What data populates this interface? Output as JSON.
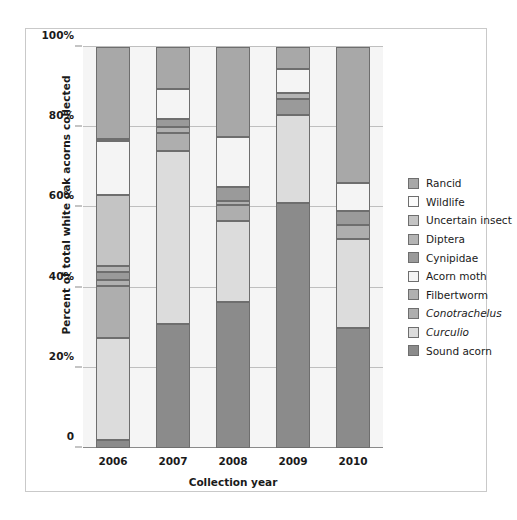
{
  "figure": {
    "y_axis_title": "Percent of total white oak acorns collected",
    "x_axis_title": "Collection year"
  },
  "legend": {
    "items": [
      {
        "label": "Rancid",
        "color": "#a8a8a8",
        "italic": false
      },
      {
        "label": "Wildlife",
        "color": "#fbfbfb",
        "italic": false
      },
      {
        "label": "Uncertain insect",
        "color": "#c4c4c4",
        "italic": false
      },
      {
        "label": "Diptera",
        "color": "#b4b4b4",
        "italic": false
      },
      {
        "label": "Cynipidae",
        "color": "#9a9a9a",
        "italic": false
      },
      {
        "label": "Acorn moth",
        "color": "#f4f4f4",
        "italic": false
      },
      {
        "label": "Filbertworm",
        "color": "#b0b0b0",
        "italic": false
      },
      {
        "label": "Conotrachelus",
        "color": "#aeaeae",
        "italic": true
      },
      {
        "label": "Curculio",
        "color": "#dcdcdc",
        "italic": true
      },
      {
        "label": "Sound acorn",
        "color": "#8b8b8b",
        "italic": false
      }
    ]
  },
  "chart_data": {
    "type": "bar",
    "subtype": "stacked-percent",
    "title": "",
    "xlabel": "Collection year",
    "ylabel": "Percent of total white oak acorns collected",
    "categories": [
      "2006",
      "2007",
      "2008",
      "2009",
      "2010"
    ],
    "ylim": [
      0,
      100
    ],
    "ytick_labels": [
      "0",
      "20%",
      "40%",
      "60%",
      "80%",
      "100%"
    ],
    "ytick_values": [
      0,
      20,
      40,
      60,
      80,
      100
    ],
    "grid": true,
    "legend_position": "right",
    "stack_order_bottom_to_top": [
      "Sound acorn",
      "Curculio",
      "Conotrachelus",
      "Filbertworm",
      "Acorn moth",
      "Cynipidae",
      "Diptera",
      "Uncertain insect",
      "Wildlife",
      "Rancid"
    ],
    "series": [
      {
        "name": "Sound acorn",
        "color": "#8b8b8b",
        "values": [
          2.0,
          31.0,
          36.5,
          61.0,
          30.0
        ]
      },
      {
        "name": "Curculio",
        "color": "#dcdcdc",
        "values": [
          25.5,
          43.0,
          20.0,
          22.0,
          22.0
        ]
      },
      {
        "name": "Conotrachelus",
        "color": "#aeaeae",
        "values": [
          13.0,
          3.0,
          4.0,
          0.0,
          3.5
        ]
      },
      {
        "name": "Filbertworm",
        "color": "#b0b0b0",
        "values": [
          1.5,
          1.5,
          1.0,
          0.0,
          0.0
        ]
      },
      {
        "name": "Acorn moth",
        "color": "#f4f4f4",
        "values": [
          0.0,
          0.0,
          0.0,
          0.0,
          0.0
        ]
      },
      {
        "name": "Cynipidae",
        "color": "#9a9a9a",
        "values": [
          2.0,
          2.0,
          4.0,
          4.0,
          3.5
        ]
      },
      {
        "name": "Diptera",
        "color": "#b4b4b4",
        "values": [
          1.5,
          1.0,
          0.0,
          1.5,
          0.0
        ]
      },
      {
        "name": "Uncertain insect",
        "color": "#c4c4c4",
        "values": [
          13.0,
          0.0,
          0.0,
          0.0,
          0.0
        ]
      },
      {
        "name": "Wildlife",
        "color": "#fbfbfb",
        "values": [
          18.5,
          7.5,
          12.0,
          6.0,
          7.0
        ]
      },
      {
        "name": "Rancid",
        "color": "#a8a8a8",
        "values": [
          23.0,
          11.0,
          22.5,
          5.5,
          34.0
        ]
      }
    ],
    "bars": [
      {
        "category": "2006",
        "segments": [
          {
            "name": "Sound acorn",
            "value": 2.0,
            "y0": 0.0,
            "y1": 2.0,
            "color": "#8b8b8b"
          },
          {
            "name": "Curculio",
            "value": 25.5,
            "y0": 2.0,
            "y1": 27.5,
            "color": "#dcdcdc"
          },
          {
            "name": "Conotrachelus",
            "value": 13.0,
            "y0": 27.5,
            "y1": 40.5,
            "color": "#aeaeae"
          },
          {
            "name": "Filbertworm",
            "value": 1.5,
            "y0": 40.5,
            "y1": 42.0,
            "color": "#b0b0b0"
          },
          {
            "name": "Cynipidae",
            "value": 2.0,
            "y0": 42.0,
            "y1": 44.0,
            "color": "#9a9a9a"
          },
          {
            "name": "Diptera",
            "value": 1.5,
            "y0": 44.0,
            "y1": 45.5,
            "color": "#b4b4b4"
          },
          {
            "name": "Uncertain insect",
            "value": 17.5,
            "y0": 45.5,
            "y1": 63.0,
            "color": "#c4c4c4"
          },
          {
            "name": "Acorn moth",
            "value": 13.5,
            "y0": 63.0,
            "y1": 76.5,
            "color": "#f4f4f4"
          },
          {
            "name": "Wildlife",
            "value": 0.5,
            "y0": 76.5,
            "y1": 77.0,
            "color": "#fbfbfb"
          },
          {
            "name": "Rancid",
            "value": 23.0,
            "y0": 77.0,
            "y1": 100.0,
            "color": "#a8a8a8"
          }
        ]
      },
      {
        "category": "2007",
        "segments": [
          {
            "name": "Sound acorn",
            "value": 31.0,
            "y0": 0.0,
            "y1": 31.0,
            "color": "#8b8b8b"
          },
          {
            "name": "Curculio",
            "value": 43.0,
            "y0": 31.0,
            "y1": 74.0,
            "color": "#dcdcdc"
          },
          {
            "name": "Conotrachelus",
            "value": 4.5,
            "y0": 74.0,
            "y1": 78.5,
            "color": "#aeaeae"
          },
          {
            "name": "Filbertworm",
            "value": 1.5,
            "y0": 78.5,
            "y1": 80.0,
            "color": "#b0b0b0"
          },
          {
            "name": "Cynipidae",
            "value": 2.0,
            "y0": 80.0,
            "y1": 82.0,
            "color": "#9a9a9a"
          },
          {
            "name": "Acorn moth",
            "value": 7.5,
            "y0": 82.0,
            "y1": 89.5,
            "color": "#f4f4f4"
          },
          {
            "name": "Rancid",
            "value": 10.5,
            "y0": 89.5,
            "y1": 100.0,
            "color": "#a8a8a8"
          }
        ]
      },
      {
        "category": "2008",
        "segments": [
          {
            "name": "Sound acorn",
            "value": 36.5,
            "y0": 0.0,
            "y1": 36.5,
            "color": "#8b8b8b"
          },
          {
            "name": "Curculio",
            "value": 20.0,
            "y0": 36.5,
            "y1": 56.5,
            "color": "#dcdcdc"
          },
          {
            "name": "Conotrachelus",
            "value": 4.0,
            "y0": 56.5,
            "y1": 60.5,
            "color": "#aeaeae"
          },
          {
            "name": "Filbertworm",
            "value": 1.0,
            "y0": 60.5,
            "y1": 61.5,
            "color": "#b0b0b0"
          },
          {
            "name": "Cynipidae",
            "value": 3.5,
            "y0": 61.5,
            "y1": 65.0,
            "color": "#9a9a9a"
          },
          {
            "name": "Acorn moth",
            "value": 12.5,
            "y0": 65.0,
            "y1": 77.5,
            "color": "#f4f4f4"
          },
          {
            "name": "Rancid",
            "value": 22.5,
            "y0": 77.5,
            "y1": 100.0,
            "color": "#a8a8a8"
          }
        ]
      },
      {
        "category": "2009",
        "segments": [
          {
            "name": "Sound acorn",
            "value": 61.0,
            "y0": 0.0,
            "y1": 61.0,
            "color": "#8b8b8b"
          },
          {
            "name": "Curculio",
            "value": 22.0,
            "y0": 61.0,
            "y1": 83.0,
            "color": "#dcdcdc"
          },
          {
            "name": "Cynipidae",
            "value": 4.0,
            "y0": 83.0,
            "y1": 87.0,
            "color": "#9a9a9a"
          },
          {
            "name": "Diptera",
            "value": 1.5,
            "y0": 87.0,
            "y1": 88.5,
            "color": "#b4b4b4"
          },
          {
            "name": "Acorn moth",
            "value": 6.0,
            "y0": 88.5,
            "y1": 94.5,
            "color": "#f4f4f4"
          },
          {
            "name": "Rancid",
            "value": 5.5,
            "y0": 94.5,
            "y1": 100.0,
            "color": "#a8a8a8"
          }
        ]
      },
      {
        "category": "2010",
        "segments": [
          {
            "name": "Sound acorn",
            "value": 30.0,
            "y0": 0.0,
            "y1": 30.0,
            "color": "#8b8b8b"
          },
          {
            "name": "Curculio",
            "value": 22.0,
            "y0": 30.0,
            "y1": 52.0,
            "color": "#dcdcdc"
          },
          {
            "name": "Conotrachelus",
            "value": 3.5,
            "y0": 52.0,
            "y1": 55.5,
            "color": "#aeaeae"
          },
          {
            "name": "Cynipidae",
            "value": 3.5,
            "y0": 55.5,
            "y1": 59.0,
            "color": "#9a9a9a"
          },
          {
            "name": "Acorn moth",
            "value": 7.0,
            "y0": 59.0,
            "y1": 66.0,
            "color": "#f4f4f4"
          },
          {
            "name": "Rancid",
            "value": 34.0,
            "y0": 66.0,
            "y1": 100.0,
            "color": "#a8a8a8"
          }
        ]
      }
    ]
  }
}
